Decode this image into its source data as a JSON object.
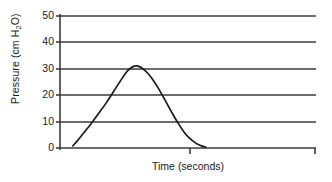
{
  "chart_data": {
    "type": "line",
    "title": "",
    "xlabel": "Time (seconds)",
    "ylabel_text": "Pressure (cm H",
    "ylabel_sub": "2",
    "ylabel_tail": "O)",
    "ylabel_full": "Pressure (cm H2O)",
    "ytick_labels": [
      "50",
      "40",
      "30",
      "20",
      "10",
      "0"
    ],
    "ytick_values": [
      50,
      40,
      30,
      20,
      10,
      0
    ],
    "ylim": [
      0,
      50
    ],
    "xlim": [
      0,
      10
    ],
    "xtick_labels": [],
    "grid": "horizontal",
    "legend": "none",
    "line_color": "#1a1a1a",
    "grid_color": "#3b3b3b",
    "axis_color": "#3b3b3b",
    "background_color": "#ffffff",
    "series": [
      {
        "name": "Airway pressure",
        "x": [
          0.5,
          0.7,
          0.95,
          1.2,
          1.5,
          1.8,
          2.1,
          2.4,
          2.6,
          2.75,
          2.9,
          3.05,
          3.2,
          3.4,
          3.6,
          3.85,
          4.1,
          4.35,
          4.6,
          4.85,
          5.05,
          5.25,
          5.4,
          5.55,
          5.7
        ],
        "y": [
          0.8,
          3.0,
          6.0,
          9.0,
          13.0,
          17.0,
          21.5,
          26.0,
          28.8,
          30.2,
          31.0,
          31.0,
          30.3,
          28.6,
          26.2,
          22.5,
          18.2,
          13.8,
          9.6,
          6.0,
          3.8,
          2.2,
          1.3,
          0.7,
          0.3
        ]
      }
    ],
    "peak_value": 31,
    "peak_time": 3.0
  }
}
